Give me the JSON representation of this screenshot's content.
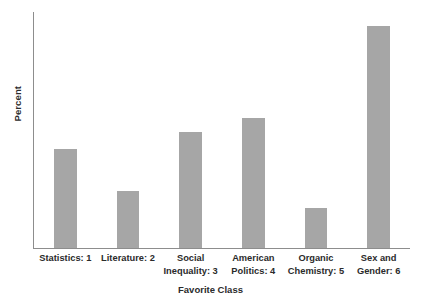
{
  "chart_data": {
    "type": "bar",
    "title": "",
    "xlabel": "Favorite Class",
    "ylabel": "Percent",
    "categories": [
      "Statistics: 1",
      "Literature: 2",
      "Social\nInequality: 3",
      "American\nPolitics: 4",
      "Organic\nChemistry: 5",
      "Sex and\nGender: 6"
    ],
    "category_short": [
      "statistics",
      "literature",
      "social-inequality",
      "american-politics",
      "organic-chemistry",
      "sex-and-gender"
    ],
    "values": [
      42,
      24,
      49,
      55,
      17,
      94
    ],
    "ylim": [
      0,
      100
    ],
    "xlim_note": "categorical",
    "grid": false,
    "legend": null,
    "bar_color": "#a6a6a6",
    "axis_color": "#8d8d8d",
    "text_color": "#2b2b2b",
    "background": "#ffffff",
    "y_ticks": [],
    "x_ticks": [
      "Statistics: 1",
      "Literature: 2",
      "Social Inequality: 3",
      "American Politics: 4",
      "Organic Chemistry: 5",
      "Sex and Gender: 6"
    ]
  }
}
